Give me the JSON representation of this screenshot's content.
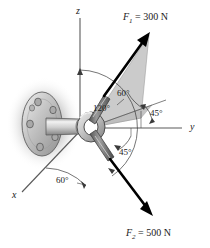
{
  "figure": {
    "background_color": "#ffffff",
    "axes": [
      {
        "name": "z-axis",
        "label": "z",
        "orientation": "vertical-up"
      },
      {
        "name": "y-axis",
        "label": "y",
        "orientation": "horizontal-right"
      },
      {
        "name": "x-axis",
        "label": "x",
        "orientation": "lower-left"
      }
    ],
    "forces": [
      {
        "name": "force-1",
        "symbol": "F",
        "subscript": "1",
        "equals": "=",
        "magnitude": "300",
        "unit": "N",
        "label": "F1 = 300 N",
        "direction": "upper-right",
        "color": "#000000"
      },
      {
        "name": "force-2",
        "symbol": "F",
        "subscript": "2",
        "equals": "=",
        "magnitude": "500",
        "unit": "N",
        "label": "F2 = 500 N",
        "direction": "lower-right",
        "color": "#000000"
      }
    ],
    "angles": [
      {
        "name": "angle-f1-from-plane",
        "value": "60",
        "unit": "°",
        "label": "60°"
      },
      {
        "name": "angle-f2-from-z-axis",
        "value": "120",
        "unit": "°",
        "label": "120°"
      },
      {
        "name": "angle-f1-plane-from-y-axis",
        "value": "45",
        "unit": "°",
        "label": "45°"
      },
      {
        "name": "angle-f2-plane-from-y-axis",
        "value": "45",
        "unit": "°",
        "label": "45°"
      },
      {
        "name": "angle-from-x-axis",
        "value": "60",
        "unit": "°",
        "label": "60°"
      }
    ],
    "hardware": {
      "name": "eyebolt-assembly",
      "parts": [
        "mounting-flange",
        "bolt-holes",
        "shaft",
        "eye-ring",
        "cable-segment-upper",
        "cable-segment-lower"
      ],
      "bolt_hole_count": 6
    },
    "colors": {
      "plane_fill": "#c9c9c9",
      "metal_light": "#e3e3e3",
      "metal_mid": "#b4b4b4",
      "metal_dark": "#8a8a8a",
      "cable": "#6e6e6e",
      "shadow": "#b8b8b8",
      "line": "#1a1a1a",
      "thin_line": "#555555"
    }
  }
}
